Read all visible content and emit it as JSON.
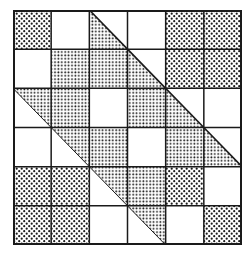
{
  "diagram": {
    "type": "quilt-grid",
    "rows": 6,
    "cols": 6,
    "legend": {
      "A": "coarse-dot-pattern",
      "B": "fine-dot-pattern",
      "W": "white",
      "TL": "triangle shaded lower-left (below diagonal)",
      "TU": "triangle shaded upper-right (above diagonal)"
    },
    "cells": [
      [
        "A",
        "W",
        "TL",
        "W",
        "A",
        "A"
      ],
      [
        "W",
        "B",
        "B",
        "TL",
        "A",
        "A"
      ],
      [
        "TU",
        "B",
        "W",
        "B",
        "TL",
        "W"
      ],
      [
        "W",
        "TU",
        "B",
        "W",
        "B",
        "TL"
      ],
      [
        "A",
        "A",
        "TU",
        "B",
        "A",
        "W"
      ],
      [
        "A",
        "A",
        "W",
        "TU",
        "W",
        "A"
      ]
    ],
    "colors": {
      "ink": "#1a1a1a",
      "paper": "#ffffff"
    }
  }
}
